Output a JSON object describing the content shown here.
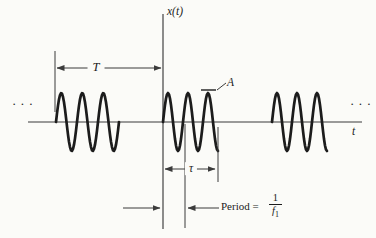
{
  "colors": {
    "paper": "#fbfbf8",
    "ink": "#1c1c1c",
    "line": "#3b3b3b"
  },
  "labels": {
    "y_axis": "x(t)",
    "x_axis": "t",
    "repetition_period": "T",
    "amplitude": "A",
    "burst_duration": "τ",
    "period_prefix": "Period =",
    "fraction_numerator": "1",
    "fraction_denominator_base": "f",
    "fraction_denominator_subscript": "1",
    "ellipsis_left": "···",
    "ellipsis_right": "···"
  },
  "waveform": {
    "axis_y": 122,
    "amplitude_px": 29,
    "bursts": [
      {
        "x0": 56,
        "cycle_px": 21,
        "cycles": 3
      },
      {
        "x0": 163,
        "cycle_px": 20,
        "cycles": 2.75
      },
      {
        "x0": 272,
        "cycle_px": 20,
        "cycles": 2.75
      }
    ]
  }
}
